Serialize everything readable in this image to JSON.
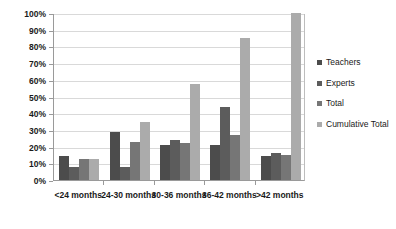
{
  "chart_data": {
    "type": "bar",
    "title": "",
    "xlabel": "",
    "ylabel": "",
    "ylim": [
      0,
      100
    ],
    "y_ticks": [
      "0%",
      "10%",
      "20%",
      "30%",
      "40%",
      "50%",
      "60%",
      "70%",
      "80%",
      "90%",
      "100%"
    ],
    "grid": true,
    "legend_position": "right",
    "categories": [
      "<24 months",
      "24-30 months",
      "30-36 months",
      "36-42 months",
      ">42 months"
    ],
    "series": [
      {
        "name": "Teachers",
        "color": "#4c4c4c",
        "values": [
          14.5,
          29.0,
          21.0,
          21.0,
          14.5
        ]
      },
      {
        "name": "Experts",
        "color": "#5c5c5c",
        "values": [
          7.5,
          7.5,
          24.0,
          44.0,
          16.0
        ]
      },
      {
        "name": "Total",
        "color": "#767676",
        "values": [
          12.5,
          23.0,
          22.0,
          27.0,
          15.0
        ]
      },
      {
        "name": "Cumulative Total",
        "color": "#ababab",
        "values": [
          12.5,
          35.0,
          57.5,
          85.0,
          100.0
        ]
      }
    ]
  }
}
